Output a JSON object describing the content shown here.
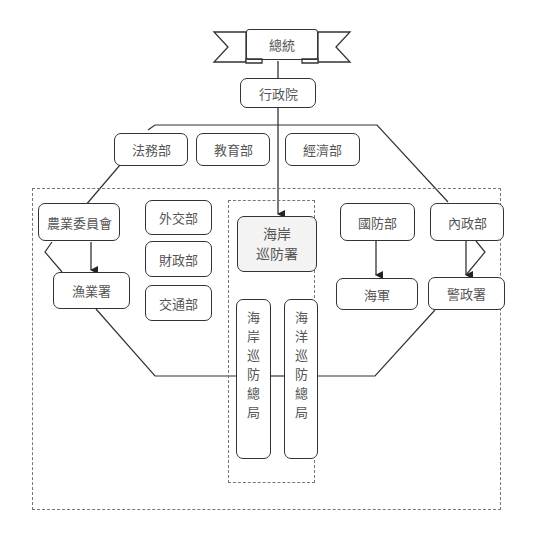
{
  "diagram": {
    "top": {
      "label": "總統"
    },
    "executive": {
      "label": "行政院"
    },
    "ministries_top": [
      {
        "label": "法務部"
      },
      {
        "label": "教育部"
      },
      {
        "label": "經濟部"
      }
    ],
    "left_group": {
      "agriculture": {
        "label": "農業委員會"
      },
      "fisheries": {
        "label": "漁業署"
      },
      "foreign": {
        "label": "外交部"
      },
      "finance": {
        "label": "財政部"
      },
      "transport": {
        "label": "交通部"
      }
    },
    "center_group": {
      "coast_guard_admin": {
        "line1": "海岸",
        "line2": "巡防署"
      },
      "coastal_patrol": {
        "chars": [
          "海",
          "岸",
          "巡",
          "防",
          "總",
          "局"
        ]
      },
      "maritime_patrol": {
        "chars": [
          "海",
          "洋",
          "巡",
          "防",
          "總",
          "局"
        ]
      }
    },
    "right_group": {
      "defense": {
        "label": "國防部"
      },
      "interior": {
        "label": "內政部"
      },
      "navy": {
        "label": "海軍"
      },
      "police": {
        "label": "警政署"
      }
    },
    "colors": {
      "line": "#333333",
      "dash": "#777777",
      "text": "#555555",
      "highlight_fill": "#f3f3f3"
    }
  }
}
